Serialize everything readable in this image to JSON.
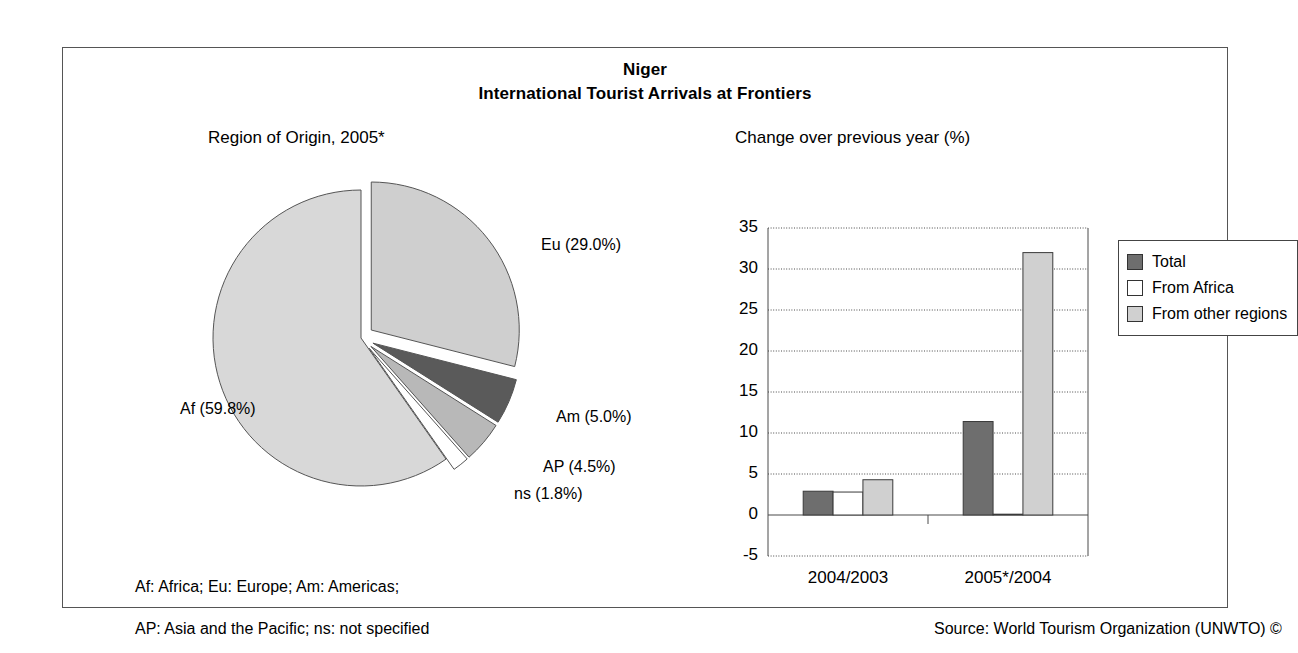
{
  "header": {
    "country": "Niger",
    "series_title": "International Tourist Arrivals at Frontiers"
  },
  "pie_subtitle": "Region of Origin, 2005*",
  "bar_subtitle": "Change over previous year (%)",
  "footnotes": {
    "line1": "Af: Africa; Eu: Europe; Am: Americas;",
    "line2": "AP: Asia and the Pacific; ns: not specified",
    "source": "Source: World Tourism Organization (UNWTO) ©"
  },
  "legend": {
    "items": [
      {
        "label": "Total",
        "color": "#6e6e6e"
      },
      {
        "label": "From Africa",
        "color": "#ffffff"
      },
      {
        "label": "From other regions",
        "color": "#d0d0d0"
      }
    ]
  },
  "chart_data": [
    {
      "type": "pie",
      "title": "Region of Origin, 2005*",
      "labels": [
        "Af (59.8%)",
        "Eu (29.0%)",
        "Am (5.0%)",
        "AP (4.5%)",
        "ns (1.8%)"
      ],
      "categories": [
        "Af",
        "Eu",
        "Am",
        "AP",
        "ns"
      ],
      "values": [
        59.8,
        29.0,
        5.0,
        4.5,
        1.8
      ],
      "colors": [
        "#d8d8d8",
        "#cfcfcf",
        "#5a5a5a",
        "#b8b8b8",
        "#ffffff"
      ],
      "exploded": [
        false,
        true,
        true,
        true,
        true
      ],
      "legend_position": "labels-outside"
    },
    {
      "type": "bar",
      "title": "Change over previous year (%)",
      "categories": [
        "2004/2003",
        "2005*/2004"
      ],
      "series": [
        {
          "name": "Total",
          "values": [
            2.9,
            11.4
          ],
          "color": "#6e6e6e"
        },
        {
          "name": "From Africa",
          "values": [
            2.8,
            0.1
          ],
          "color": "#ffffff"
        },
        {
          "name": "From other regions",
          "values": [
            4.3,
            32.0
          ],
          "color": "#d0d0d0"
        }
      ],
      "ylabel": "",
      "xlabel": "",
      "ylim": [
        -5,
        35
      ],
      "yticks": [
        -5,
        0,
        5,
        10,
        15,
        20,
        25,
        30,
        35
      ],
      "ytick_labels": [
        "-5",
        "0",
        "5",
        "10",
        "15",
        "20",
        "25",
        "30",
        "35"
      ],
      "grid": true,
      "legend_position": "right"
    }
  ]
}
